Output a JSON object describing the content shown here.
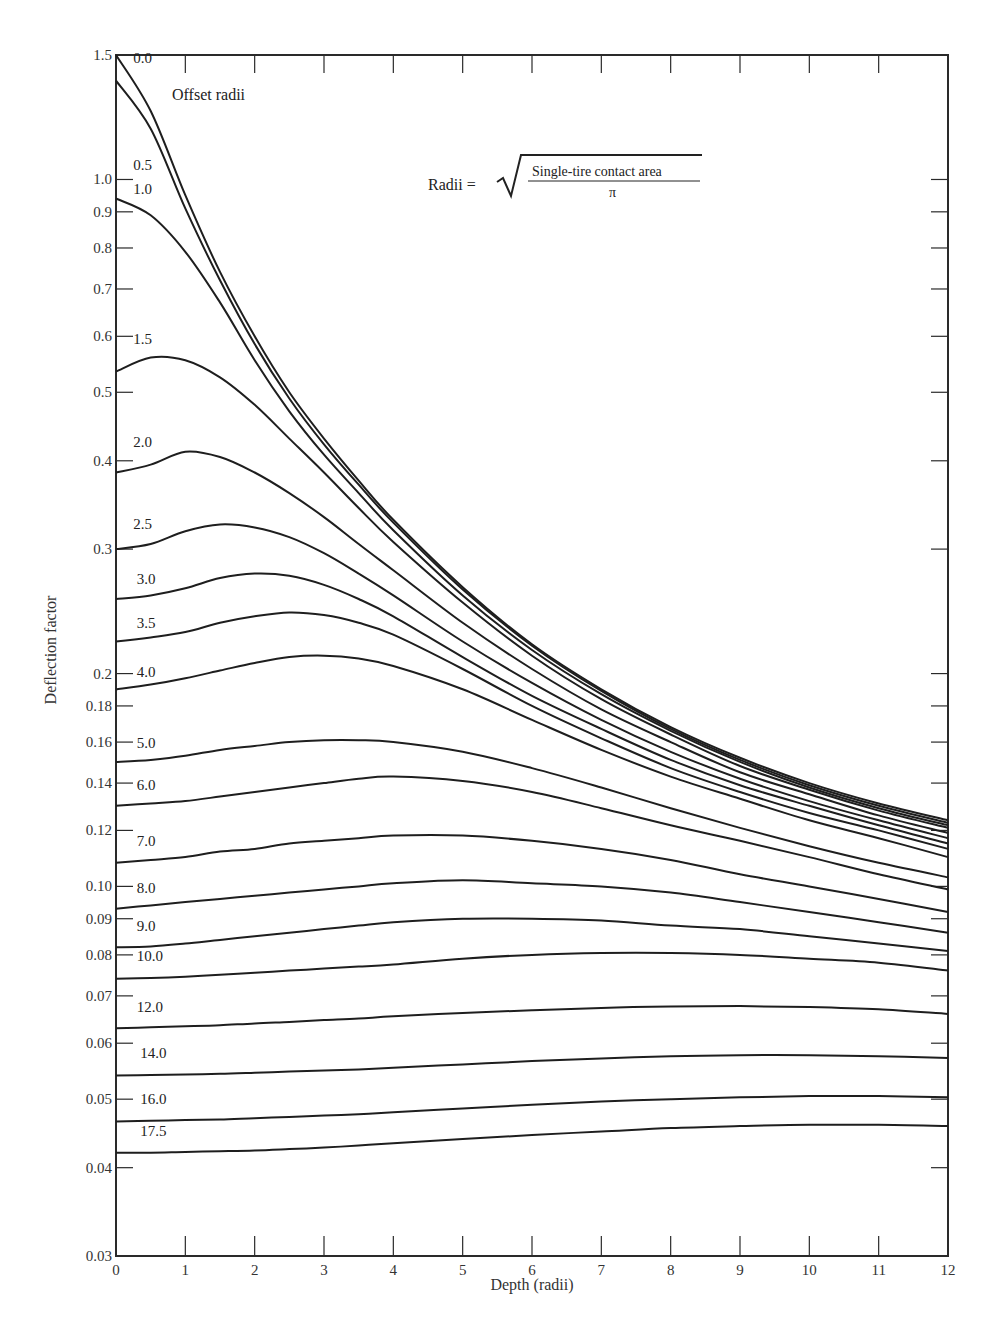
{
  "chart_data": {
    "type": "line",
    "title": "",
    "xlabel": "Depth (radii)",
    "ylabel": "Deflection factor",
    "x_scale": "linear",
    "y_scale": "log",
    "xlim": [
      0,
      12
    ],
    "ylim": [
      0.03,
      1.5
    ],
    "x_ticks": [
      0,
      1,
      2,
      3,
      4,
      5,
      6,
      7,
      8,
      9,
      10,
      11,
      12
    ],
    "x_tick_labels": [
      "0",
      "1",
      "2",
      "3",
      "4",
      "5",
      "6",
      "7",
      "8",
      "9",
      "10",
      "11",
      "12"
    ],
    "y_ticks": [
      1.5,
      1.0,
      0.9,
      0.8,
      0.7,
      0.6,
      0.5,
      0.4,
      0.3,
      0.2,
      0.18,
      0.16,
      0.14,
      0.12,
      0.1,
      0.09,
      0.08,
      0.07,
      0.06,
      0.05,
      0.04,
      0.03
    ],
    "y_tick_labels": [
      "1.5",
      "1.0",
      "0.9",
      "0.8",
      "0.7",
      "0.6",
      "0.5",
      "0.4",
      "0.3",
      "0.2",
      "0.18",
      "0.16",
      "0.14",
      "0.12",
      "0.10",
      "0.09",
      "0.08",
      "0.07",
      "0.06",
      "0.05",
      "0.04",
      "0.03"
    ],
    "grid": false,
    "legend_title": "Offset radii",
    "annotation": {
      "lhs": "Radii =",
      "numerator": "Single-tire contact area",
      "denominator": "π"
    },
    "x": [
      0,
      0.5,
      1,
      1.5,
      2,
      2.5,
      3,
      3.5,
      4,
      5,
      6,
      7,
      8,
      9,
      10,
      11,
      12
    ],
    "series": [
      {
        "name": "0.0",
        "values": [
          1.5,
          1.25,
          0.95,
          0.74,
          0.6,
          0.5,
          0.43,
          0.375,
          0.33,
          0.265,
          0.22,
          0.19,
          0.168,
          0.152,
          0.14,
          0.131,
          0.124
        ]
      },
      {
        "name": "0.5",
        "values": [
          1.38,
          1.18,
          0.91,
          0.72,
          0.585,
          0.49,
          0.422,
          0.37,
          0.327,
          0.263,
          0.219,
          0.189,
          0.167,
          0.151,
          0.139,
          0.13,
          0.123
        ]
      },
      {
        "name": "1.0",
        "values": [
          0.94,
          0.89,
          0.79,
          0.67,
          0.555,
          0.47,
          0.408,
          0.36,
          0.319,
          0.258,
          0.216,
          0.187,
          0.166,
          0.15,
          0.138,
          0.129,
          0.122
        ]
      },
      {
        "name": "1.5",
        "values": [
          0.535,
          0.56,
          0.555,
          0.525,
          0.48,
          0.43,
          0.385,
          0.343,
          0.307,
          0.252,
          0.212,
          0.184,
          0.164,
          0.148,
          0.137,
          0.128,
          0.121
        ]
      },
      {
        "name": "2.0",
        "values": [
          0.385,
          0.395,
          0.412,
          0.405,
          0.385,
          0.36,
          0.333,
          0.305,
          0.28,
          0.236,
          0.203,
          0.178,
          0.16,
          0.145,
          0.135,
          0.126,
          0.119
        ]
      },
      {
        "name": "2.5",
        "values": [
          0.3,
          0.305,
          0.318,
          0.325,
          0.322,
          0.312,
          0.296,
          0.277,
          0.258,
          0.222,
          0.194,
          0.172,
          0.155,
          0.142,
          0.132,
          0.124,
          0.117
        ]
      },
      {
        "name": "3.0",
        "values": [
          0.255,
          0.258,
          0.264,
          0.273,
          0.277,
          0.275,
          0.267,
          0.255,
          0.241,
          0.211,
          0.186,
          0.167,
          0.151,
          0.139,
          0.13,
          0.122,
          0.115
        ]
      },
      {
        "name": "3.5",
        "values": [
          0.222,
          0.225,
          0.229,
          0.236,
          0.241,
          0.244,
          0.242,
          0.236,
          0.227,
          0.203,
          0.18,
          0.162,
          0.147,
          0.136,
          0.127,
          0.12,
          0.113
        ]
      },
      {
        "name": "4.0",
        "values": [
          0.19,
          0.193,
          0.197,
          0.202,
          0.207,
          0.211,
          0.212,
          0.21,
          0.205,
          0.19,
          0.172,
          0.156,
          0.143,
          0.133,
          0.124,
          0.117,
          0.11
        ]
      },
      {
        "name": "5.0",
        "values": [
          0.15,
          0.151,
          0.153,
          0.156,
          0.158,
          0.16,
          0.161,
          0.161,
          0.16,
          0.155,
          0.147,
          0.138,
          0.129,
          0.121,
          0.114,
          0.108,
          0.103
        ]
      },
      {
        "name": "6.0",
        "values": [
          0.13,
          0.131,
          0.132,
          0.134,
          0.136,
          0.138,
          0.14,
          0.142,
          0.143,
          0.141,
          0.136,
          0.129,
          0.122,
          0.116,
          0.11,
          0.104,
          0.099
        ]
      },
      {
        "name": "7.0",
        "values": [
          0.108,
          0.109,
          0.11,
          0.112,
          0.113,
          0.115,
          0.116,
          0.117,
          0.118,
          0.118,
          0.116,
          0.113,
          0.109,
          0.104,
          0.1,
          0.096,
          0.092
        ]
      },
      {
        "name": "8.0",
        "values": [
          0.093,
          0.094,
          0.095,
          0.096,
          0.097,
          0.098,
          0.099,
          0.1,
          0.101,
          0.102,
          0.101,
          0.1,
          0.098,
          0.095,
          0.092,
          0.089,
          0.086
        ]
      },
      {
        "name": "9.0",
        "values": [
          0.082,
          0.0822,
          0.083,
          0.084,
          0.085,
          0.086,
          0.087,
          0.088,
          0.089,
          0.09,
          0.09,
          0.0895,
          0.088,
          0.087,
          0.085,
          0.083,
          0.081
        ]
      },
      {
        "name": "10.0",
        "values": [
          0.074,
          0.0742,
          0.0745,
          0.075,
          0.0755,
          0.076,
          0.0765,
          0.077,
          0.0775,
          0.079,
          0.08,
          0.0805,
          0.0805,
          0.08,
          0.079,
          0.078,
          0.076
        ]
      },
      {
        "name": "12.0",
        "values": [
          0.063,
          0.0632,
          0.0634,
          0.0636,
          0.064,
          0.0643,
          0.0647,
          0.065,
          0.0655,
          0.0662,
          0.0668,
          0.0673,
          0.0676,
          0.0677,
          0.0675,
          0.067,
          0.066
        ]
      },
      {
        "name": "14.0",
        "values": [
          0.054,
          0.0541,
          0.0542,
          0.0543,
          0.0545,
          0.0547,
          0.0549,
          0.0551,
          0.0554,
          0.056,
          0.0566,
          0.0571,
          0.0575,
          0.0577,
          0.0577,
          0.0575,
          0.0572
        ]
      },
      {
        "name": "16.0",
        "values": [
          0.0465,
          0.0466,
          0.0467,
          0.0468,
          0.047,
          0.0472,
          0.0474,
          0.0476,
          0.0479,
          0.0485,
          0.0491,
          0.0496,
          0.05,
          0.0503,
          0.0505,
          0.0505,
          0.0503
        ]
      },
      {
        "name": "17.5",
        "values": [
          0.042,
          0.042,
          0.0421,
          0.0422,
          0.0423,
          0.0425,
          0.0427,
          0.043,
          0.0433,
          0.0439,
          0.0445,
          0.045,
          0.0455,
          0.0458,
          0.046,
          0.046,
          0.0458
        ]
      }
    ],
    "curve_label_positions": [
      {
        "name": "0.0",
        "x": 0.25,
        "y": 1.46
      },
      {
        "name": "0.5",
        "x": 0.25,
        "y": 1.03
      },
      {
        "name": "1.0",
        "x": 0.25,
        "y": 0.955
      },
      {
        "name": "1.5",
        "x": 0.25,
        "y": 0.585
      },
      {
        "name": "2.0",
        "x": 0.25,
        "y": 0.418
      },
      {
        "name": "2.5",
        "x": 0.25,
        "y": 0.32
      },
      {
        "name": "3.0",
        "x": 0.3,
        "y": 0.268
      },
      {
        "name": "3.5",
        "x": 0.3,
        "y": 0.232
      },
      {
        "name": "4.0",
        "x": 0.3,
        "y": 0.198
      },
      {
        "name": "5.0",
        "x": 0.3,
        "y": 0.157
      },
      {
        "name": "6.0",
        "x": 0.3,
        "y": 0.137
      },
      {
        "name": "7.0",
        "x": 0.3,
        "y": 0.114
      },
      {
        "name": "8.0",
        "x": 0.3,
        "y": 0.098
      },
      {
        "name": "9.0",
        "x": 0.3,
        "y": 0.0865
      },
      {
        "name": "10.0",
        "x": 0.3,
        "y": 0.0785
      },
      {
        "name": "12.0",
        "x": 0.3,
        "y": 0.0665
      },
      {
        "name": "14.0",
        "x": 0.35,
        "y": 0.0572
      },
      {
        "name": "16.0",
        "x": 0.35,
        "y": 0.0492
      },
      {
        "name": "17.5",
        "x": 0.35,
        "y": 0.0444
      }
    ]
  },
  "colors": {
    "line": "#1e1e1e",
    "axis": "#2a2a2a",
    "text": "#2a2a2a",
    "background": "#ffffff"
  }
}
